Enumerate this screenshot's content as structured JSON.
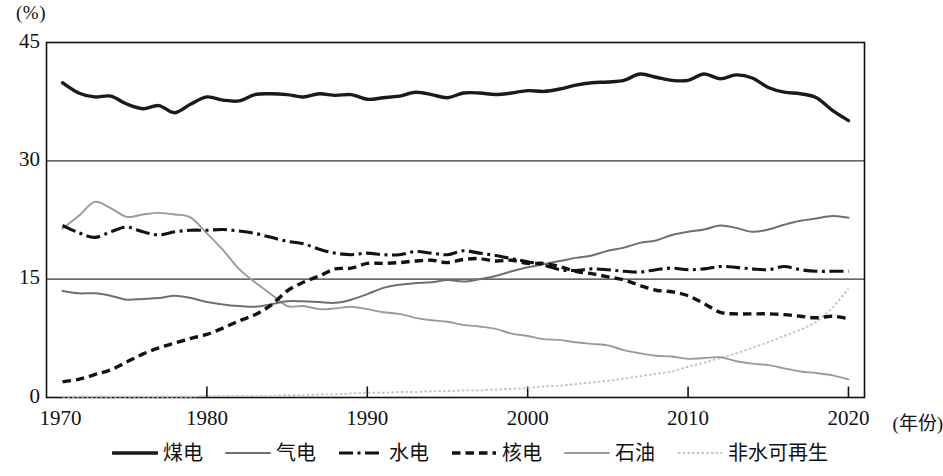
{
  "chart_data": {
    "type": "line",
    "title": "",
    "xlabel": "(年份)",
    "ylabel": "(%)",
    "xlim": [
      1970,
      2021
    ],
    "ylim": [
      0,
      45
    ],
    "xticks": [
      "1970",
      "1980",
      "1990",
      "2000",
      "2010",
      "2020"
    ],
    "xtick_values": [
      1970,
      1980,
      1990,
      2000,
      2010,
      2020
    ],
    "yticks": [
      "0",
      "15",
      "30",
      "45"
    ],
    "ytick_values": [
      0,
      15,
      30,
      45
    ],
    "grid": "horizontal-at-15-and-30",
    "legend_position": "bottom-center",
    "x": [
      1971,
      1972,
      1973,
      1974,
      1975,
      1976,
      1977,
      1978,
      1979,
      1980,
      1981,
      1982,
      1983,
      1984,
      1985,
      1986,
      1987,
      1988,
      1989,
      1990,
      1991,
      1992,
      1993,
      1994,
      1995,
      1996,
      1997,
      1998,
      1999,
      2000,
      2001,
      2002,
      2003,
      2004,
      2005,
      2006,
      2007,
      2008,
      2009,
      2010,
      2011,
      2012,
      2013,
      2014,
      2015,
      2016,
      2017,
      2018,
      2019,
      2020
    ],
    "series": [
      {
        "name": "煤电",
        "style": "solid-thick-black",
        "color": "#1a1a1a",
        "values": [
          39.9,
          38.6,
          38.1,
          38.2,
          37.2,
          36.6,
          37.0,
          36.1,
          37.2,
          38.1,
          37.7,
          37.6,
          38.4,
          38.5,
          38.4,
          38.1,
          38.5,
          38.3,
          38.4,
          37.8,
          38.0,
          38.2,
          38.7,
          38.4,
          38.0,
          38.6,
          38.6,
          38.4,
          38.6,
          38.9,
          38.8,
          39.1,
          39.6,
          39.9,
          40.0,
          40.2,
          41.0,
          40.6,
          40.2,
          40.2,
          41.0,
          40.4,
          40.9,
          40.5,
          39.3,
          38.7,
          38.5,
          38.0,
          36.4,
          35.1
        ]
      },
      {
        "name": "气电",
        "style": "solid-gray",
        "color": "#6f6f6f",
        "values": [
          13.5,
          13.2,
          13.2,
          12.9,
          12.4,
          12.5,
          12.6,
          12.9,
          12.6,
          12.1,
          11.8,
          11.6,
          11.5,
          11.8,
          12.2,
          12.2,
          12.1,
          12.0,
          12.4,
          13.1,
          13.9,
          14.3,
          14.5,
          14.6,
          14.9,
          14.7,
          15.0,
          15.4,
          16.0,
          16.5,
          16.9,
          17.3,
          17.7,
          18.0,
          18.6,
          19.0,
          19.6,
          19.9,
          20.6,
          21.0,
          21.3,
          21.8,
          21.5,
          21.0,
          21.3,
          21.9,
          22.4,
          22.7,
          23.0,
          22.8
        ]
      },
      {
        "name": "水电",
        "style": "dash-dot-black",
        "color": "#121212",
        "values": [
          21.8,
          20.9,
          20.3,
          21.0,
          21.6,
          21.0,
          20.6,
          21.0,
          21.2,
          21.2,
          21.3,
          21.1,
          20.8,
          20.3,
          19.8,
          19.5,
          18.8,
          18.3,
          18.1,
          18.3,
          18.1,
          18.1,
          18.5,
          18.3,
          18.1,
          18.6,
          18.3,
          18.0,
          17.6,
          17.2,
          16.8,
          16.2,
          16.1,
          16.3,
          16.2,
          16.0,
          15.9,
          16.2,
          16.4,
          16.2,
          16.3,
          16.6,
          16.5,
          16.3,
          16.2,
          16.6,
          16.2,
          16.0,
          16.0,
          16.0
        ]
      },
      {
        "name": "核电",
        "style": "dashed-black",
        "color": "#121212",
        "values": [
          2.0,
          2.3,
          2.9,
          3.5,
          4.5,
          5.5,
          6.3,
          6.9,
          7.5,
          8.0,
          8.8,
          9.7,
          10.5,
          11.7,
          13.5,
          14.6,
          15.4,
          16.3,
          16.4,
          17.0,
          17.0,
          17.1,
          17.3,
          17.4,
          17.1,
          17.5,
          17.6,
          17.3,
          17.4,
          17.0,
          17.0,
          16.6,
          16.0,
          15.7,
          15.3,
          14.9,
          14.2,
          13.6,
          13.4,
          12.9,
          11.9,
          10.8,
          10.6,
          10.6,
          10.6,
          10.5,
          10.3,
          10.1,
          10.3,
          10.0
        ]
      },
      {
        "name": "石油",
        "style": "solid-light-gray",
        "color": "#9a9a9a",
        "values": [
          21.4,
          23.0,
          24.8,
          24.0,
          22.9,
          23.2,
          23.4,
          23.2,
          22.8,
          20.8,
          18.7,
          16.3,
          14.6,
          13.1,
          11.6,
          11.6,
          11.2,
          11.3,
          11.5,
          11.2,
          10.8,
          10.6,
          10.1,
          9.8,
          9.6,
          9.2,
          9.0,
          8.7,
          8.1,
          7.8,
          7.4,
          7.3,
          7.0,
          6.8,
          6.6,
          6.0,
          5.6,
          5.3,
          5.2,
          4.9,
          5.0,
          5.1,
          4.6,
          4.3,
          4.1,
          3.7,
          3.3,
          3.1,
          2.8,
          2.3
        ]
      },
      {
        "name": "非水可再生",
        "style": "dotted-light-gray",
        "color": "#c3c3c3",
        "values": [
          0.1,
          0.1,
          0.1,
          0.1,
          0.1,
          0.1,
          0.1,
          0.1,
          0.1,
          0.2,
          0.2,
          0.2,
          0.2,
          0.2,
          0.3,
          0.3,
          0.4,
          0.4,
          0.5,
          0.6,
          0.6,
          0.7,
          0.7,
          0.8,
          0.8,
          0.9,
          0.9,
          1.0,
          1.1,
          1.2,
          1.4,
          1.5,
          1.7,
          1.9,
          2.1,
          2.4,
          2.7,
          3.0,
          3.3,
          3.9,
          4.4,
          5.0,
          5.6,
          6.3,
          7.0,
          7.8,
          8.6,
          9.6,
          11.4,
          13.8
        ]
      }
    ]
  },
  "yaxis": {
    "unit_label": "(%)",
    "ticks": [
      {
        "label": "45",
        "value": 45
      },
      {
        "label": "30",
        "value": 30
      },
      {
        "label": "15",
        "value": 15
      },
      {
        "label": "0",
        "value": 0
      }
    ]
  },
  "xaxis": {
    "unit_label": "(年份)",
    "ticks": [
      {
        "label": "1970",
        "value": 1970
      },
      {
        "label": "1980",
        "value": 1980
      },
      {
        "label": "1990",
        "value": 1990
      },
      {
        "label": "2000",
        "value": 2000
      },
      {
        "label": "2010",
        "value": 2010
      },
      {
        "label": "2020",
        "value": 2020
      }
    ]
  },
  "legend": {
    "items": [
      {
        "label": "煤电",
        "style": "solid-thick-black",
        "color": "#1a1a1a"
      },
      {
        "label": "气电",
        "style": "solid-gray",
        "color": "#6f6f6f"
      },
      {
        "label": "水电",
        "style": "dash-dot-black",
        "color": "#121212"
      },
      {
        "label": "核电",
        "style": "dashed-black",
        "color": "#121212"
      },
      {
        "label": "石油",
        "style": "solid-light-gray",
        "color": "#9a9a9a"
      },
      {
        "label": "非水可再生",
        "style": "dotted-light-gray",
        "color": "#c3c3c3"
      }
    ]
  }
}
